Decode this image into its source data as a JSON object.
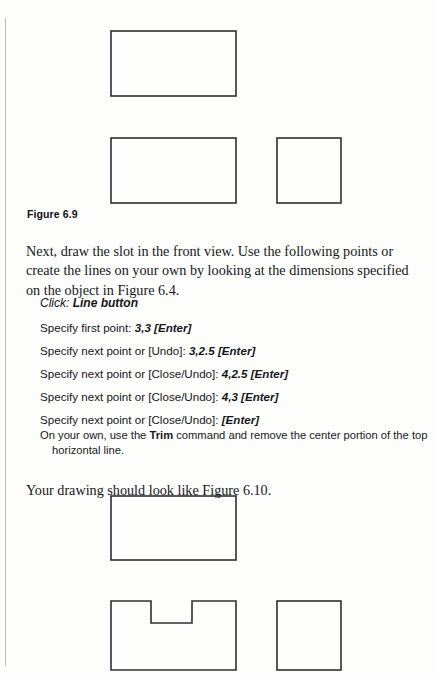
{
  "page": {
    "background_color": "#fdfdfc",
    "ink_color": "#1b1b1b",
    "gutter_rule_color": "#b9b9b9"
  },
  "figure_69": {
    "caption": "Figure 6.9",
    "shapes": [
      {
        "name": "top-view-rectangle",
        "type": "rect",
        "x": 111,
        "y": 31,
        "w": 125,
        "h": 65
      },
      {
        "name": "front-view-rectangle",
        "type": "rect",
        "x": 111,
        "y": 138,
        "w": 125,
        "h": 65
      },
      {
        "name": "side-view-square",
        "type": "rect",
        "x": 277,
        "y": 138,
        "w": 64,
        "h": 65
      }
    ]
  },
  "intro_paragraph": "Next, draw the slot in the front view. Use the following points or create the lines on your own by looking at the dimensions specified on the object in Figure 6.4.",
  "command_sequence": {
    "click_label": "Click:",
    "click_target": "Line button",
    "steps": [
      {
        "prompt": "Specify first point:",
        "value": "3,3 [Enter]"
      },
      {
        "prompt": "Specify next point or [Undo]:",
        "value": "3,2.5 [Enter]"
      },
      {
        "prompt": "Specify next point or [Close/Undo]:",
        "value": "4,2.5 [Enter]"
      },
      {
        "prompt": "Specify next point or [Close/Undo]:",
        "value": "4,3 [Enter]"
      },
      {
        "prompt": "Specify next point or [Close/Undo]:",
        "value": "[Enter]"
      }
    ]
  },
  "note": {
    "lead": "On your own, use the ",
    "command": "Trim",
    "tail": " command and remove the center portion of the top",
    "continuation": "horizontal line."
  },
  "closing_paragraph": "Your drawing should look like Figure 6.10.",
  "figure_610": {
    "shapes": [
      {
        "name": "top-view-rectangle",
        "type": "rect",
        "x": 111,
        "y": 496,
        "w": 125,
        "h": 64
      },
      {
        "name": "front-view-slotted-outline",
        "type": "path",
        "points": "111,601 151,601 151,623 192,623 192,601 236,601 236,670 111,670"
      },
      {
        "name": "side-view-square",
        "type": "rect",
        "x": 277,
        "y": 601,
        "w": 64,
        "h": 69
      }
    ]
  }
}
